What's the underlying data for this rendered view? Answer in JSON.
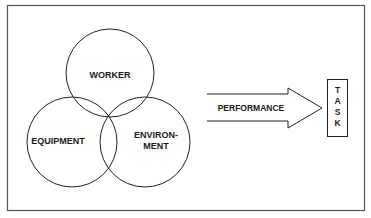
{
  "diagram": {
    "colors": {
      "background": "#ffffff",
      "stroke": "#222222",
      "frame": "#555555",
      "text": "#1a1a1a"
    },
    "circles": [
      {
        "id": "worker",
        "label_lines": [
          "WORKER"
        ]
      },
      {
        "id": "equipment",
        "label_lines": [
          "EQUIPMENT"
        ]
      },
      {
        "id": "environment",
        "label_lines": [
          "ENVIRON-",
          "MENT"
        ]
      }
    ],
    "arrow": {
      "label": "PERFORMANCE"
    },
    "task_box": {
      "letters": [
        "T",
        "A",
        "S",
        "K"
      ]
    }
  }
}
